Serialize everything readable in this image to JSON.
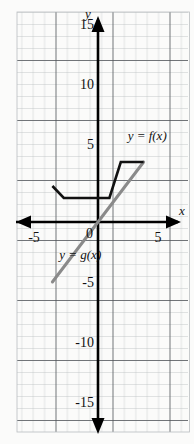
{
  "figure": {
    "title": "",
    "background_color": "#ffffff",
    "paper_tint": "#f4f4f2"
  },
  "axes": {
    "x_axis_label": "x",
    "y_axis_label": "y",
    "origin_label": "0",
    "x_tick_labels": [
      "-5",
      "5"
    ],
    "y_tick_labels": [
      "15",
      "10",
      "5",
      "-5",
      "-10",
      "-15"
    ],
    "x_range": [
      -6.8,
      6.8
    ],
    "y_range": [
      -16.5,
      16.5
    ],
    "grid_minor_step": 1,
    "grid_major_step": 5,
    "grid": true,
    "axis_color": "#000000",
    "grid_minor_color": "#b9bcc0",
    "grid_major_color": "#4a4e52"
  },
  "chart_data": {
    "type": "line",
    "title": "",
    "xlabel": "x",
    "ylabel": "y",
    "xlim": [
      -6.8,
      6.8
    ],
    "ylim": [
      -16.5,
      16.5
    ],
    "grid": true,
    "legend_position": "inline-annotation",
    "series": [
      {
        "name": "y = f(x)",
        "color": "#111111",
        "label": "y = f(x)",
        "label_x": 2.6,
        "label_y": 6.8,
        "points": [
          {
            "x": -4,
            "y": 3
          },
          {
            "x": -3,
            "y": 2
          },
          {
            "x": 1,
            "y": 2
          },
          {
            "x": 2,
            "y": 5
          },
          {
            "x": 4,
            "y": 5
          }
        ]
      },
      {
        "name": "y = g(x)",
        "color": "#8a8a8a",
        "label": "y = g(x)",
        "label_x": -3.4,
        "label_y": -3.1,
        "points": [
          {
            "x": -4,
            "y": -5
          },
          {
            "x": 4,
            "y": 5
          }
        ]
      }
    ]
  }
}
